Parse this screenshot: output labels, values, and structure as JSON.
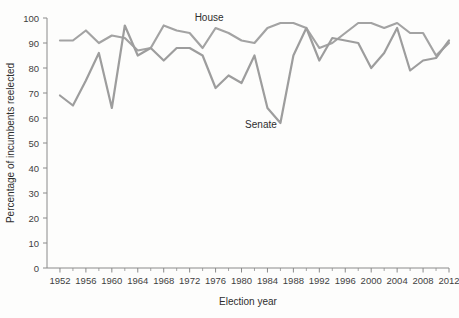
{
  "chart_data": {
    "type": "line",
    "title": "",
    "xlabel": "Election year",
    "ylabel": "Percentage of incumbents reelected",
    "xlim": [
      1950,
      2012
    ],
    "ylim": [
      0,
      100
    ],
    "grid": false,
    "legend_position": "inline-annotation",
    "x": [
      1952,
      1954,
      1956,
      1958,
      1960,
      1962,
      1964,
      1966,
      1968,
      1970,
      1972,
      1974,
      1976,
      1978,
      1980,
      1982,
      1984,
      1986,
      1988,
      1990,
      1992,
      1994,
      1996,
      1998,
      2000,
      2002,
      2004,
      2006,
      2008,
      2010,
      2012
    ],
    "xticks": [
      1952,
      1956,
      1960,
      1964,
      1968,
      1972,
      1976,
      1980,
      1984,
      1988,
      1992,
      1996,
      2000,
      2004,
      2008,
      2012
    ],
    "xtick_labels": [
      "1952",
      "1956",
      "1960",
      "1964",
      "1968",
      "1972",
      "1976",
      "1980",
      "1984",
      "1988",
      "1992",
      "1996",
      "2000",
      "2004",
      "2008",
      "2012"
    ],
    "xminor_ticks": [
      1954,
      1958,
      1962,
      1966,
      1970,
      1974,
      1978,
      1982,
      1986,
      1990,
      1994,
      1998,
      2002,
      2006,
      2010
    ],
    "yticks": [
      0,
      10,
      20,
      30,
      40,
      50,
      60,
      70,
      80,
      90,
      100
    ],
    "ytick_labels": [
      "0",
      "10",
      "20",
      "30",
      "40",
      "50",
      "60",
      "70",
      "80",
      "90",
      "100"
    ],
    "series": [
      {
        "name": "House",
        "color": "#a3a3a3",
        "label_x": 1975,
        "label_y": 99,
        "values": [
          91,
          91,
          95,
          90,
          93,
          92,
          87,
          88,
          97,
          95,
          94,
          88,
          96,
          94,
          91,
          90,
          96,
          98,
          98,
          96,
          88,
          90,
          94,
          98,
          98,
          96,
          98,
          94,
          94,
          85,
          90
        ]
      },
      {
        "name": "Senate",
        "color": "#9d9d9d",
        "label_x": 1983,
        "label_y": 56,
        "values": [
          69,
          65,
          75,
          86,
          64,
          97,
          85,
          88,
          83,
          88,
          88,
          85,
          72,
          77,
          74,
          85,
          64,
          58,
          85,
          96,
          83,
          92,
          91,
          90,
          80,
          86,
          96,
          79,
          83,
          84,
          91
        ]
      }
    ]
  },
  "axis": {
    "x_title": "Election year",
    "y_title": "Percentage of incumbents reelected"
  }
}
